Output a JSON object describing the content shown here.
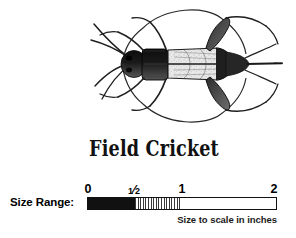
{
  "page": {
    "background_color": "#ffffff",
    "ink_color": "#111111"
  },
  "illustration": {
    "subject": "field-cricket-dorsal-view",
    "description": "Black and white scientific line drawing of a field cricket seen from above, with long antennae sweeping forward-left, stippled forewings, dark pronotum, six legs and a long ovipositor extending to the right",
    "alt_text": "Field Cricket"
  },
  "title": {
    "species_name": "Field Cricket"
  },
  "size_range": {
    "label": "Size Range:",
    "caption": "Size to scale in inches",
    "unit": "inches",
    "axis_min": 0,
    "axis_max": 2,
    "ticks": [
      {
        "value": 0,
        "label": "0",
        "position_pct": 0
      },
      {
        "value": 0.5,
        "label": "½",
        "numerator": "1",
        "denominator": "2",
        "position_pct": 25
      },
      {
        "value": 1,
        "label": "1",
        "position_pct": 50
      },
      {
        "value": 2,
        "label": "2",
        "position_pct": 100
      }
    ],
    "segments": [
      {
        "name": "solid-range",
        "from": 0,
        "to": 0.5,
        "fill": "solid-black"
      },
      {
        "name": "hatched-range",
        "from": 0.5,
        "to": 1,
        "fill": "vertical-hatch"
      },
      {
        "name": "empty-range",
        "from": 1,
        "to": 2,
        "fill": "white"
      }
    ],
    "measured_range_text": "0–½ in. solid, ½–1 in. hatched"
  }
}
